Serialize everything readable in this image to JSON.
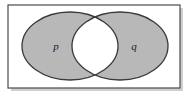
{
  "figure": {
    "name": "venn-diagram-two-sets",
    "width": 190,
    "height": 99,
    "background_color": "#ffffff"
  },
  "frame": {
    "name": "universe-rectangle",
    "x": 8,
    "y": 5,
    "width": 172,
    "height": 83,
    "stroke_color": "#4a4a4a",
    "stroke_width": 1.2,
    "fill_color": "#ffffff",
    "shadow_color": "#cfcfcf"
  },
  "sets": [
    {
      "name": "set-p",
      "label": "p",
      "cx": 70,
      "cy": 46,
      "rx": 48,
      "ry": 34,
      "fill_color": "#b8b8b8",
      "stroke_color": "#3a3a3a",
      "stroke_width": 1.3,
      "label_x": 56,
      "label_y": 47,
      "shaded": true
    },
    {
      "name": "set-q",
      "label": "q",
      "cx": 120,
      "cy": 46,
      "rx": 48,
      "ry": 34,
      "fill_color": "#b8b8b8",
      "stroke_color": "#3a3a3a",
      "stroke_width": 1.3,
      "label_x": 134,
      "label_y": 47,
      "shaded": true
    }
  ],
  "intersection": {
    "name": "intersection-lens",
    "fill_color": "#ffffff",
    "shaded": false,
    "label": "",
    "crossing_top_x": 95,
    "crossing_top_y": 18,
    "crossing_bottom_x": 95,
    "crossing_bottom_y": 75
  }
}
